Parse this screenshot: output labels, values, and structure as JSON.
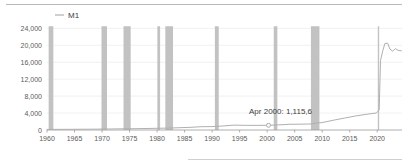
{
  "chart_data": {
    "type": "line",
    "title": "",
    "subtitle": "",
    "xlabel": "",
    "ylabel": "",
    "xlim": [
      1960,
      2024.5
    ],
    "ylim": [
      0,
      25500
    ],
    "grid": true,
    "legend_position": "top-left",
    "y_ticks": [
      0,
      4000,
      8000,
      12000,
      16000,
      20000,
      24000
    ],
    "y_tick_labels": [
      "0",
      "4,000",
      "8,000",
      "12,000",
      "16,000",
      "20,000",
      "24,000"
    ],
    "x_ticks": [
      1960,
      1965,
      1970,
      1975,
      1980,
      1985,
      1990,
      1995,
      2000,
      2005,
      2010,
      2015,
      2020
    ],
    "x_tick_labels": [
      "1960",
      "1965",
      "1970",
      "1975",
      "1980",
      "1985",
      "1990",
      "1995",
      "2000",
      "2005",
      "2010",
      "2015",
      "2020"
    ],
    "series": [
      {
        "name": "M1",
        "color": "#b0b0b0",
        "x": [
          1960,
          1962,
          1964,
          1966,
          1968,
          1970,
          1972,
          1974,
          1976,
          1978,
          1980,
          1982,
          1984,
          1986,
          1988,
          1990,
          1992,
          1994,
          1996,
          1998,
          2000.25,
          2002,
          2004,
          2006,
          2008,
          2009,
          2010,
          2012,
          2014,
          2016,
          2018,
          2019.8,
          2020.35,
          2020.6,
          2021,
          2021.4,
          2021.9,
          2022.3,
          2022.8,
          2023.3,
          2023.8,
          2024.4
        ],
        "y": [
          140,
          147,
          160,
          172,
          190,
          215,
          250,
          280,
          310,
          355,
          400,
          450,
          540,
          620,
          780,
          800,
          950,
          1150,
          1100,
          1090,
          1115.6,
          1200,
          1350,
          1370,
          1430,
          1650,
          1750,
          2300,
          2800,
          3300,
          3700,
          4000,
          4700,
          16400,
          18700,
          20450,
          20500,
          19100,
          18600,
          19200,
          18800,
          18700
        ],
        "annotations": [
          {
            "x": 2000.25,
            "y": 1115.6,
            "label": "Apr 2000: 1,115,6",
            "marker": "open-circle"
          }
        ]
      }
    ],
    "recession_bands": [
      {
        "start": 1960.3,
        "end": 1961.15
      },
      {
        "start": 1969.9,
        "end": 1970.9
      },
      {
        "start": 1973.9,
        "end": 1975.2
      },
      {
        "start": 1980.05,
        "end": 1980.55
      },
      {
        "start": 1981.5,
        "end": 1982.9
      },
      {
        "start": 1990.5,
        "end": 1991.2
      },
      {
        "start": 2001.2,
        "end": 2001.85
      },
      {
        "start": 2007.95,
        "end": 2009.5
      },
      {
        "start": 2020.1,
        "end": 2020.35
      }
    ],
    "recession_color": "#c2c2c2",
    "recession_max": 24500
  },
  "legend": {
    "entries": [
      {
        "label": "M1",
        "color": "#b0b0b0"
      }
    ]
  },
  "annotation": {
    "text": "Apr 2000: 1,115,6"
  }
}
